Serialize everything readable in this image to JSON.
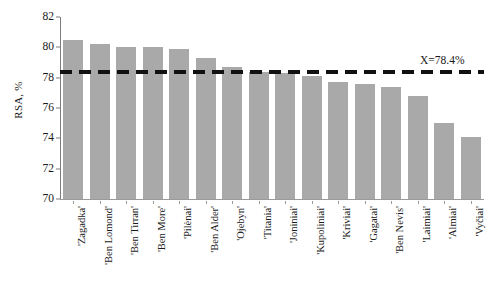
{
  "chart_data": {
    "type": "bar",
    "title": "",
    "xlabel": "",
    "ylabel": "RSA, %",
    "ylim": [
      70,
      82
    ],
    "ytick_step": 2,
    "yticks": [
      70,
      72,
      74,
      76,
      78,
      80,
      82
    ],
    "grid": false,
    "legend": null,
    "bar_color": "#a9a9a9",
    "categories": [
      "'Zagadka'",
      "'Ben Lomond'",
      "'Ben Tirran'",
      "'Ben More'",
      "'Pilėnai'",
      "'Ben Alder'",
      "'Ojebyn'",
      "'Titania'",
      "'Joniniai'",
      "'Kupoliniai'",
      "'Kriviai'",
      "'Gagatai'",
      "'Ben Nevis'",
      "'Laimiai'",
      "'Almiai'",
      "'Vyčiai'"
    ],
    "values": [
      80.5,
      80.2,
      80.0,
      80.0,
      79.9,
      79.3,
      78.7,
      78.4,
      78.3,
      78.1,
      77.7,
      77.6,
      77.4,
      76.8,
      75.0,
      74.1
    ],
    "annotations": [
      {
        "name": "mean-reference-line",
        "label": "X=78.4%",
        "value": 78.4,
        "style": "dashed",
        "color": "#111111"
      }
    ]
  }
}
